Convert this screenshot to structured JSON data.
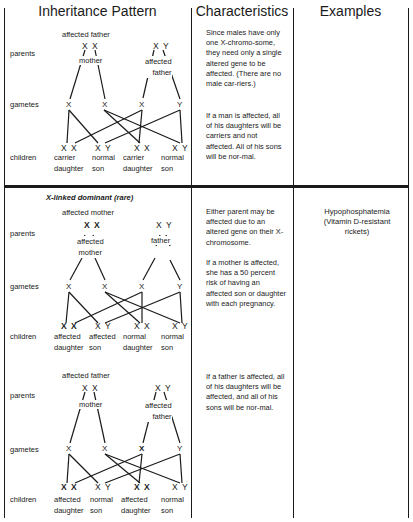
{
  "table": {
    "headers": [
      "Inheritance Pattern",
      "Characteristics",
      "Examples"
    ],
    "row_labels": {
      "parents": "parents",
      "gametes": "gametes",
      "children": "children"
    }
  },
  "section1": {
    "title": "",
    "mother_caption": "affected father",
    "parent1_genotype": "X X",
    "parent1_label": "mother",
    "parent2_genotype": "X Y",
    "parent2_label": "affected\nfather",
    "gametes": [
      "X",
      "X",
      "X",
      "Y"
    ],
    "children": [
      {
        "genotype": "X X",
        "label": "carrier\ndaughter"
      },
      {
        "genotype": "X Y",
        "label": "normal\nson"
      },
      {
        "genotype": "X X",
        "label": "carrier\ndaughter"
      },
      {
        "genotype": "X Y",
        "label": "normal\nson"
      }
    ],
    "characteristics": [
      "Since males have only one X-chromo-some, they need only a single altered gene to be affected. (There are no male car-riers.)",
      "If a man is affected, all of his daughters will be carriers and not affected. All of his sons will be nor-mal."
    ],
    "example": ""
  },
  "section2": {
    "title": "X-linked dominant (rare)",
    "caption": "affected mother",
    "parent1_genotype": "X X",
    "parent1_label": "affected\nmother",
    "parent2_genotype": "X Y",
    "parent2_label": "father",
    "gametes": [
      "X",
      "X",
      "X",
      "Y"
    ],
    "children": [
      {
        "genotype": "X X",
        "label": "affected\ndaughter"
      },
      {
        "genotype": "X Y",
        "label": "affected\nson"
      },
      {
        "genotype": "X X",
        "label": "normal\ndaughter"
      },
      {
        "genotype": "X Y",
        "label": "normal\nson"
      }
    ],
    "characteristics": [
      "Either parent may be affected due to an altered gene on their X-chromosome.",
      "If a mother is affected, she has a 50 percent risk of having an affected son or daughter with each pregnancy."
    ],
    "example": "Hypophosphatemia\n(Vitamin D-resistant\nrickets)"
  },
  "section3": {
    "caption": "affected father",
    "parent1_genotype": "X X",
    "parent1_label": "mother",
    "parent2_genotype": "X Y",
    "parent2_label": "affected\nfather",
    "gametes": [
      "X",
      "X",
      "X",
      "Y"
    ],
    "children": [
      {
        "genotype": "X X",
        "label": "affected\ndaughter"
      },
      {
        "genotype": "X Y",
        "label": "normal\nson"
      },
      {
        "genotype": "X X",
        "label": "affected\ndaughter"
      },
      {
        "genotype": "X Y",
        "label": "normal\nson"
      }
    ],
    "characteristics": [
      "If a father is affected, all of his daughters will be affected, and all of his sons will be nor-mal."
    ]
  }
}
